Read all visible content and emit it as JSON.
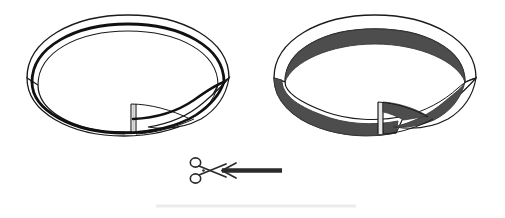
{
  "page": {
    "background_color": "#ffffff",
    "width": 505,
    "height": 218
  },
  "illustration": {
    "caption": "",
    "figures": [
      {
        "id": "left-mobius-strip",
        "label": "Möbius strip with centerline cut guide",
        "style": "outline",
        "outline_color": "#1a1a1a",
        "fill_color": "#ffffff",
        "guideline_color": "#111111",
        "guideline_description": "thick black line along the centerline of the band",
        "bounds": {
          "x": 25,
          "y": 14,
          "width": 207,
          "height": 122
        }
      },
      {
        "id": "right-mobius-strip",
        "label": "Möbius strip with one face shaded",
        "style": "shaded",
        "outline_color": "#1a1a1a",
        "fill_color": "#ffffff",
        "shade_color": "#4d4d4d",
        "shade_description": "lower half of the band shaded dark gray",
        "bounds": {
          "x": 272,
          "y": 14,
          "width": 208,
          "height": 122
        }
      }
    ],
    "instruction_marker": {
      "id": "cut-instruction",
      "scissors": {
        "icon_name": "scissors-icon",
        "color": "#2b2b2b",
        "position": {
          "x": 188,
          "y": 157
        }
      },
      "arrow": {
        "icon_name": "arrow-left-icon",
        "color": "#2b2b2b",
        "direction": "left",
        "position": {
          "x": 215,
          "y": 169
        },
        "length": 65
      },
      "text": ""
    },
    "footer_rule": {
      "id": "footer-divider",
      "color": "#ebebeb",
      "x_start": 156,
      "x_end": 356,
      "y": 206
    }
  },
  "colors": {
    "ink": "#1a1a1a",
    "shade": "#4d4d4d",
    "guide": "#111111",
    "marker": "#2b2b2b",
    "rule": "#ebebeb",
    "paper": "#ffffff"
  }
}
